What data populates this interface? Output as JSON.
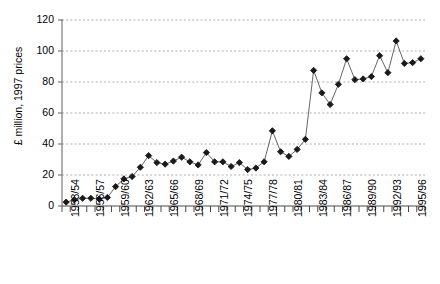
{
  "chart_data": {
    "type": "line",
    "title": "",
    "xlabel": "",
    "ylabel": "£ million, 1997 prices",
    "ylim": [
      0,
      120
    ],
    "ytick_values": [
      0,
      20,
      40,
      60,
      80,
      100,
      120
    ],
    "ytick_labels": [
      "0",
      "20",
      "40",
      "60",
      "80",
      "100",
      "120"
    ],
    "grid": true,
    "grid_style": "dashed-horizontal",
    "legend": "none",
    "marker": "diamond",
    "marker_color": "#1a1a1a",
    "line_color": "#555555",
    "x": [
      "1953/54",
      "1954/55",
      "1955/56",
      "1956/57",
      "1957/58",
      "1958/59",
      "1959/60",
      "1960/61",
      "1961/62",
      "1962/63",
      "1963/64",
      "1964/65",
      "1965/66",
      "1966/67",
      "1967/68",
      "1968/69",
      "1969/70",
      "1970/71",
      "1971/72",
      "1972/73",
      "1973/74",
      "1974/75",
      "1975/76",
      "1976/77",
      "1977/78",
      "1978/79",
      "1979/80",
      "1980/81",
      "1981/82",
      "1982/83",
      "1983/84",
      "1984/85",
      "1985/86",
      "1986/87",
      "1987/88",
      "1988/89",
      "1989/90",
      "1990/91",
      "1991/92",
      "1992/93",
      "1993/94",
      "1994/95",
      "1995/96",
      "1996/97"
    ],
    "xtick_labels_shown": [
      "1953/54",
      "1956/57",
      "1959/60",
      "1962/63",
      "1965/66",
      "1968/69",
      "1971/72",
      "1974/75",
      "1977/78",
      "1980/81",
      "1983/84",
      "1986/87",
      "1989/90",
      "1992/93",
      "1995/96"
    ],
    "xtick_label_interval": 3,
    "values": [
      2.5,
      4.0,
      5.0,
      5.0,
      4.5,
      5.5,
      12.5,
      17.5,
      19.0,
      25.0,
      32.5,
      28.0,
      27.0,
      29.0,
      31.5,
      28.5,
      26.5,
      34.5,
      28.5,
      28.5,
      25.5,
      28.0,
      23.5,
      24.5,
      28.5,
      48.5,
      35.0,
      32.0,
      36.5,
      43.0,
      87.5,
      73.0,
      65.5,
      78.5,
      95.0,
      81.5,
      82.0,
      83.5,
      97.0,
      86.0,
      106.5,
      92.0,
      92.5,
      95.0
    ]
  },
  "top_partial_text": ""
}
